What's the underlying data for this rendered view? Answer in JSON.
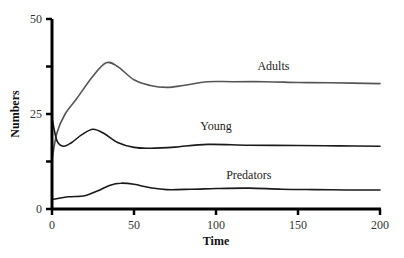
{
  "chart_data": {
    "type": "line",
    "title": "",
    "xlabel": "Time",
    "ylabel": "Numbers",
    "xlim": [
      0,
      200
    ],
    "ylim": [
      0,
      50
    ],
    "x_ticks": [
      0,
      50,
      100,
      150,
      200
    ],
    "x_tick_labels": [
      "0",
      "50",
      "100",
      "150",
      "200"
    ],
    "y_ticks": [
      0,
      12.5,
      25,
      37.5,
      50
    ],
    "y_tick_labels": [
      "0",
      "",
      "25",
      "",
      "50"
    ],
    "grid": false,
    "legend": "inline labels",
    "series": [
      {
        "name": "Adults",
        "color": "#555555",
        "x": [
          0,
          3,
          8,
          15,
          25,
          33,
          40,
          50,
          60,
          70,
          80,
          95,
          110,
          130,
          150,
          170,
          200
        ],
        "values": [
          13,
          20,
          25,
          29,
          35,
          38.5,
          37.5,
          34,
          32.5,
          32,
          32.5,
          33.5,
          33.5,
          33.5,
          33.3,
          33.2,
          33
        ]
      },
      {
        "name": "Young",
        "color": "#1a1a1a",
        "x": [
          0,
          3,
          7,
          12,
          18,
          25,
          32,
          40,
          50,
          60,
          75,
          95,
          120,
          150,
          175,
          200
        ],
        "values": [
          24,
          18,
          16.5,
          17.5,
          19.5,
          21,
          19.8,
          17.5,
          16.2,
          16,
          16.3,
          17,
          16.8,
          16.7,
          16.6,
          16.5
        ]
      },
      {
        "name": "Predators",
        "color": "#1a1a1a",
        "x": [
          0,
          10,
          20,
          28,
          35,
          42,
          50,
          60,
          70,
          85,
          100,
          120,
          140,
          160,
          180,
          200
        ],
        "values": [
          2.5,
          3.2,
          3.5,
          4.8,
          6.2,
          6.8,
          6.5,
          5.6,
          5.1,
          5.2,
          5.4,
          5.5,
          5.2,
          5.1,
          5,
          5
        ]
      }
    ],
    "annotations": [
      {
        "text": "Adults",
        "x": 135,
        "y": 36.5
      },
      {
        "text": "Young",
        "x": 100,
        "y": 20.8
      },
      {
        "text": "Predators",
        "x": 120,
        "y": 7.8
      }
    ]
  }
}
